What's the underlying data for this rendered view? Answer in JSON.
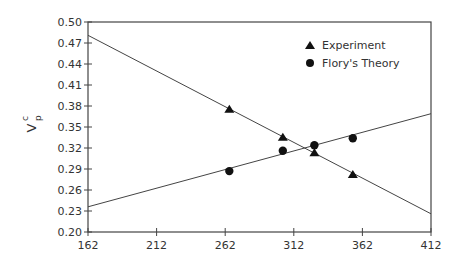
{
  "chart_data": {
    "type": "scatter",
    "title": "",
    "xlabel": "",
    "ylabel": "V_p^c",
    "xlim": [
      162,
      412
    ],
    "ylim": [
      0.2,
      0.5
    ],
    "x_ticks": [
      "162",
      "212",
      "262",
      "312",
      "362",
      "412"
    ],
    "y_ticks": [
      "0.20",
      "0.23",
      "0.26",
      "0.29",
      "0.32",
      "0.35",
      "0.38",
      "0.41",
      "0.44",
      "0.47",
      "0.50"
    ],
    "grid": false,
    "legend_position": "upper right",
    "series": [
      {
        "name": "Experiment",
        "marker": "triangle",
        "x": [
          265,
          304,
          327,
          355
        ],
        "y": [
          0.376,
          0.336,
          0.314,
          0.283
        ],
        "fit_line": {
          "x": [
            162,
            412
          ],
          "y": [
            0.481,
            0.226
          ]
        }
      },
      {
        "name": "Flory's Theory",
        "marker": "circle",
        "x": [
          265,
          304,
          327,
          355
        ],
        "y": [
          0.287,
          0.316,
          0.324,
          0.334
        ],
        "fit_line": {
          "x": [
            162,
            412
          ],
          "y": [
            0.236,
            0.369
          ]
        }
      }
    ]
  },
  "labels": {
    "ylabel_main": "V",
    "ylabel_sup": "c",
    "ylabel_sub": "p",
    "legend_experiment": "Experiment",
    "legend_theory": "Flory's Theory"
  }
}
